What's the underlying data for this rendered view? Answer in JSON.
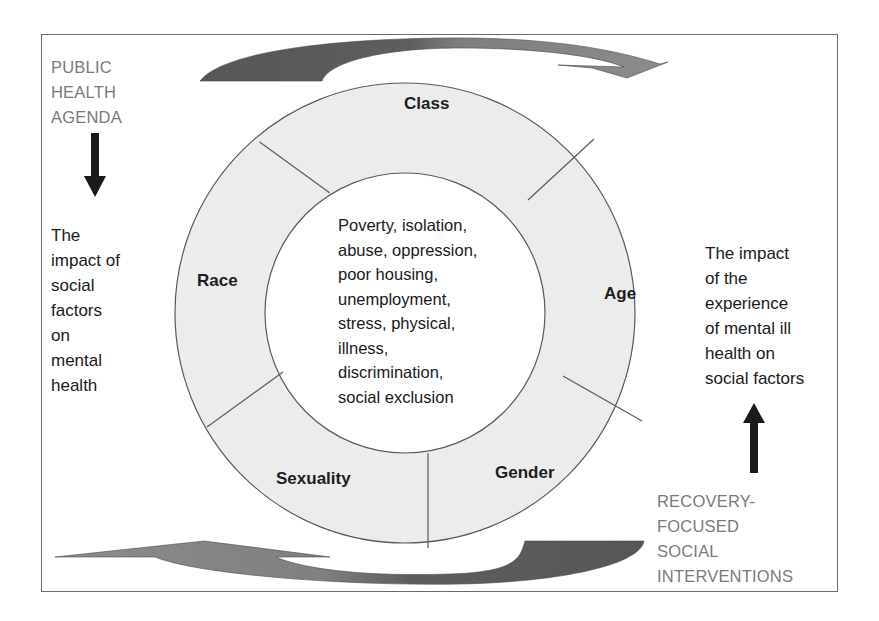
{
  "diagram": {
    "type": "circular-factor-diagram",
    "outer_ring_segments": [
      {
        "id": "class",
        "label": "Class"
      },
      {
        "id": "age",
        "label": "Age"
      },
      {
        "id": "gender",
        "label": "Gender"
      },
      {
        "id": "sexuality",
        "label": "Sexuality"
      },
      {
        "id": "race",
        "label": "Race"
      }
    ],
    "center_lines": [
      "Poverty, isolation,",
      "abuse, oppression,",
      "poor housing,",
      "unemployment,",
      "stress, physical,",
      "illness,",
      "discrimination,",
      "social exclusion"
    ],
    "left_panel": {
      "heading_lines": [
        "PUBLIC",
        "HEALTH",
        "AGENDA"
      ],
      "arrow": "down-arrow",
      "body_lines": [
        "The",
        "impact of",
        "social",
        "factors",
        "on",
        "mental",
        "health"
      ]
    },
    "right_panel": {
      "body_lines": [
        "The impact",
        "of the",
        "experience",
        "of mental ill",
        "health on",
        "social factors"
      ],
      "arrow": "up-arrow",
      "heading_lines": [
        "RECOVERY-",
        "FOCUSED",
        "SOCIAL",
        "INTERVENTIONS"
      ]
    },
    "flow_arrows": [
      {
        "id": "top",
        "direction": "clockwise-right"
      },
      {
        "id": "bottom",
        "direction": "clockwise-left"
      }
    ],
    "colors": {
      "ring_fill": "#ececec",
      "ring_stroke": "#5a5a5a",
      "arrow_dark": "#5b5b5b",
      "arrow_light": "#8a8a8a",
      "gray_text": "#7a7a7a",
      "black_text": "#1a1a1a",
      "frame": "#6a6a6a"
    }
  }
}
